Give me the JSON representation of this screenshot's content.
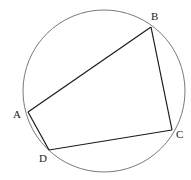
{
  "diagram": {
    "type": "cyclic-quadrilateral",
    "colors": {
      "circle": "#7a7a7a",
      "edges": "#1a1a1a",
      "labels": "#222222",
      "background": "#ffffff"
    },
    "circle": {
      "cx": 104,
      "cy": 91,
      "r": 81
    },
    "vertices": [
      {
        "name": "A",
        "x": 28,
        "y": 112,
        "label": "A",
        "label_x": 13,
        "label_y": 118
      },
      {
        "name": "B",
        "x": 151,
        "y": 27,
        "label": "B",
        "label_x": 151,
        "label_y": 20
      },
      {
        "name": "C",
        "x": 172,
        "y": 130,
        "label": "C",
        "label_x": 176,
        "label_y": 138
      },
      {
        "name": "D",
        "x": 49,
        "y": 150,
        "label": "D",
        "label_x": 39,
        "label_y": 162
      }
    ],
    "edges": [
      {
        "from": "A",
        "to": "B"
      },
      {
        "from": "B",
        "to": "C"
      },
      {
        "from": "C",
        "to": "D"
      },
      {
        "from": "D",
        "to": "A"
      }
    ]
  }
}
